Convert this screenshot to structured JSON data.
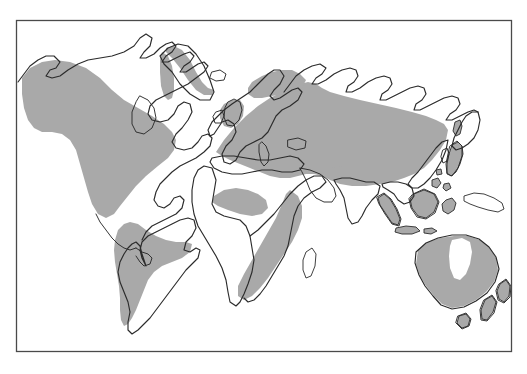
{
  "figure": {
    "kind": "world-distribution-map",
    "projection_note": "rectangular world map with border frame",
    "title": "",
    "caption": "",
    "legend": [],
    "labels": []
  },
  "colors": {
    "background": "#ffffff",
    "frame_stroke": "#4a4a4a",
    "coastline_stroke": "#2b2b2b",
    "range_fill": "#a9a9a9",
    "unshaded_fill": "#ffffff"
  },
  "frame": {
    "x": 16,
    "y": 20,
    "width": 496,
    "height": 332
  },
  "regions": [
    {
      "name": "North America",
      "shaded": true,
      "note": "western and central North America shaded; Canadian Arctic and eastern Canada unshaded"
    },
    {
      "name": "Greenland",
      "shaded": true,
      "note": "coastal strip shaded"
    },
    {
      "name": "South America",
      "shaded": true,
      "note": "central and southern South America shaded; Amazon basin and northern coast unshaded"
    },
    {
      "name": "Europe",
      "shaded": true,
      "note": "British Isles, northern and central Europe shaded"
    },
    {
      "name": "North Africa",
      "shaded": false,
      "note": "Sahara unshaded"
    },
    {
      "name": "West Africa",
      "shaded": true,
      "note": "Guinea coast belt shaded"
    },
    {
      "name": "East and Southern Africa",
      "shaded": true,
      "note": "eastern highlands through southern Africa shaded"
    },
    {
      "name": "Madagascar",
      "shaded": false,
      "note": "outline only"
    },
    {
      "name": "Northern Asia",
      "shaded": false,
      "note": "Siberia north of roughly 60N unshaded"
    },
    {
      "name": "Central and East Asia",
      "shaded": true,
      "note": "broad shaded belt across Central Asia to China"
    },
    {
      "name": "India",
      "shaded": false,
      "note": "peninsula unshaded"
    },
    {
      "name": "Japan",
      "shaded": true,
      "note": "shaded"
    },
    {
      "name": "Southeast Asian islands",
      "shaded": true,
      "note": "Sumatra, Borneo, Sulawesi, Java shaded"
    },
    {
      "name": "New Guinea",
      "shaded": false,
      "note": "outline only"
    },
    {
      "name": "Australia",
      "shaded": true,
      "note": "shaded except a white interior lobe in the north-central region"
    },
    {
      "name": "Tasmania",
      "shaded": true,
      "note": "shaded"
    },
    {
      "name": "New Zealand",
      "shaded": true,
      "note": "both islands shaded"
    }
  ]
}
